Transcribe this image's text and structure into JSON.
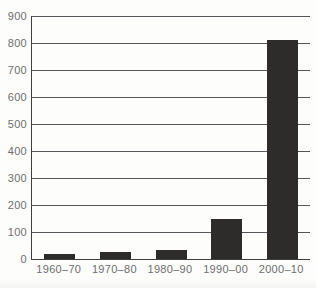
{
  "chart_data": {
    "type": "bar",
    "categories": [
      "1960–70",
      "1970–80",
      "1980–90",
      "1990–00",
      "2000–10"
    ],
    "values": [
      20,
      25,
      35,
      150,
      810
    ],
    "title": "",
    "xlabel": "",
    "ylabel": "",
    "ylim": [
      0,
      900
    ],
    "ytick_interval": 100,
    "ytick_labels": [
      "0",
      "100",
      "200",
      "300",
      "400",
      "500",
      "600",
      "700",
      "800",
      "900"
    ],
    "grid": true,
    "legend": false,
    "bar_width_px": 31,
    "bar_color": "#2d2c2a",
    "gridline_color": "#55565a",
    "axis_color": "#3f3f3f",
    "label_color": "#6e6e6e",
    "background": "#fdfdfc"
  }
}
